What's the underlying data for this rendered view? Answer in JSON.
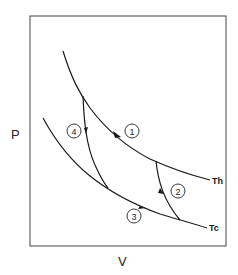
{
  "diagram": {
    "type": "Carnot cycle P-V diagram",
    "axes": {
      "x_label": "V",
      "y_label": "P"
    },
    "isotherms": [
      {
        "id": "hot",
        "label": "Th"
      },
      {
        "id": "cold",
        "label": "Tc"
      }
    ],
    "steps": [
      {
        "number": "1",
        "process": "isothermal expansion along Th"
      },
      {
        "number": "2",
        "process": "adiabatic expansion"
      },
      {
        "number": "3",
        "process": "isothermal along Tc"
      },
      {
        "number": "4",
        "process": "adiabatic compression"
      }
    ],
    "colors": {
      "line": "#1a1a1a",
      "frame": "#444444",
      "background": "#ffffff"
    }
  }
}
